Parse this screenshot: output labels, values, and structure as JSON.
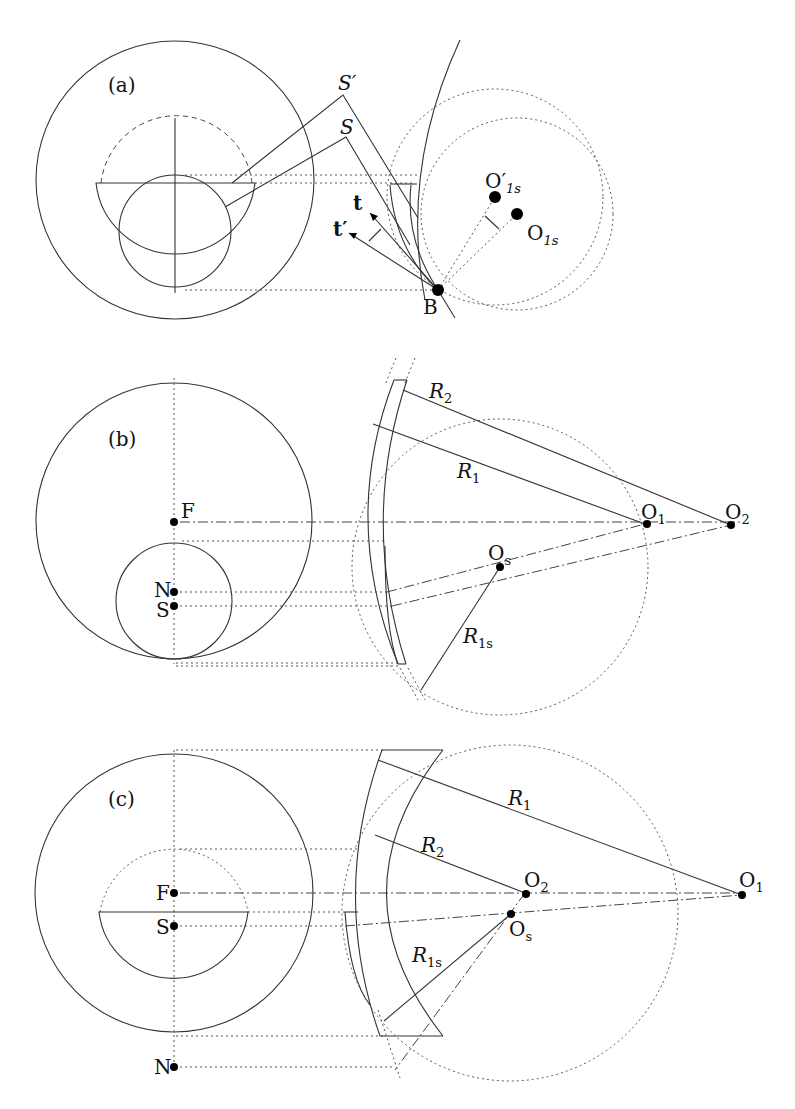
{
  "figure": {
    "panels": [
      {
        "id": "a",
        "label": "(a)",
        "points": {
          "S_prime": "S′",
          "S": "S",
          "B": "B",
          "O1s_prime": "O′",
          "O1s_prime_sub": "1s",
          "O1s": "O",
          "O1s_sub": "1s"
        },
        "vectors": {
          "t": "t",
          "t_prime": "t′"
        }
      },
      {
        "id": "b",
        "label": "(b)",
        "points": {
          "F": "F",
          "N": "N",
          "S": "S",
          "O1": "O",
          "O1_sub": "1",
          "O2": "O",
          "O2_sub": "2",
          "Os": "O",
          "Os_sub": "s"
        },
        "radii": {
          "R2": "R",
          "R2_sub": "2",
          "R1": "R",
          "R1_sub": "1",
          "R1s": "R",
          "R1s_sub": "1s"
        }
      },
      {
        "id": "c",
        "label": "(c)",
        "points": {
          "F": "F",
          "S": "S",
          "N": "N",
          "O1": "O",
          "O1_sub": "1",
          "O2": "O",
          "O2_sub": "2",
          "Os": "O",
          "Os_sub": "s"
        },
        "radii": {
          "R1": "R",
          "R1_sub": "1",
          "R2": "R",
          "R2_sub": "2",
          "R1s": "R",
          "R1s_sub": "1s"
        }
      }
    ]
  }
}
